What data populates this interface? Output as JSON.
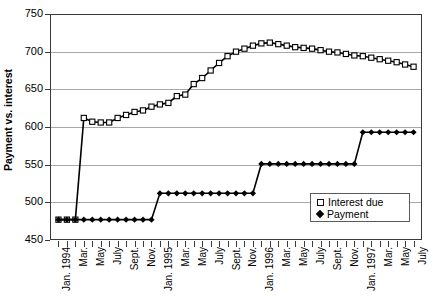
{
  "chart_data": {
    "type": "line",
    "title": "",
    "xlabel": "",
    "ylabel": "Payment vs. interest",
    "ylim": [
      450,
      750
    ],
    "yticks": [
      450,
      500,
      550,
      600,
      650,
      700,
      750
    ],
    "grid": true,
    "legend_position": "inside-bottom-right",
    "x": [
      "Jan. 1994",
      "Feb.",
      "Mar.",
      "Apr.",
      "May",
      "June",
      "July",
      "Aug.",
      "Sept.",
      "Oct.",
      "Nov.",
      "Dec.",
      "Jan. 1995",
      "Feb.",
      "Mar.",
      "Apr.",
      "May",
      "June",
      "July",
      "Aug.",
      "Sept.",
      "Oct.",
      "Nov.",
      "Dec.",
      "Jan. 1996",
      "Feb.",
      "Mar.",
      "Apr.",
      "May",
      "June",
      "July",
      "Aug.",
      "Sept.",
      "Oct.",
      "Nov.",
      "Dec.",
      "Jan. 1997",
      "Feb.",
      "Mar.",
      "Apr.",
      "May",
      "June",
      "July"
    ],
    "x_tick_labels": [
      "Jan. 1994",
      "",
      "Mar.",
      "",
      "May",
      "",
      "July",
      "",
      "Sept.",
      "",
      "Nov.",
      "",
      "Jan. 1995",
      "",
      "Mar.",
      "",
      "May",
      "",
      "July",
      "",
      "Sept.",
      "",
      "Nov.",
      "",
      "Jan. 1996",
      "",
      "Mar.",
      "",
      "May",
      "",
      "July",
      "",
      "Sept.",
      "",
      "Nov.",
      "",
      "Jan. 1997",
      "",
      "Mar.",
      "",
      "May",
      "",
      "July"
    ],
    "series": [
      {
        "name": "Interest due",
        "marker": "open-square",
        "values": [
          477,
          477,
          477,
          612,
          607,
          606,
          606,
          612,
          616,
          620,
          622,
          627,
          630,
          632,
          641,
          643,
          657,
          665,
          675,
          685,
          694,
          700,
          704,
          708,
          711,
          712,
          710,
          708,
          706,
          705,
          704,
          702,
          700,
          699,
          697,
          695,
          694,
          692,
          690,
          688,
          686,
          683,
          680
        ]
      },
      {
        "name": "Payment",
        "marker": "solid-diamond",
        "values": [
          477,
          477,
          477,
          477,
          477,
          477,
          477,
          477,
          477,
          477,
          477,
          477,
          512,
          512,
          512,
          512,
          512,
          512,
          512,
          512,
          512,
          512,
          512,
          512,
          551,
          551,
          551,
          551,
          551,
          551,
          551,
          551,
          551,
          551,
          551,
          551,
          593,
          593,
          593,
          593,
          593,
          593,
          593
        ]
      }
    ],
    "legend_entries": [
      "Interest due",
      "Payment"
    ],
    "colors": {
      "line": "#000000",
      "grid": "#a8a8a8",
      "axis": "#3a3a3a",
      "background": "#ffffff"
    }
  }
}
